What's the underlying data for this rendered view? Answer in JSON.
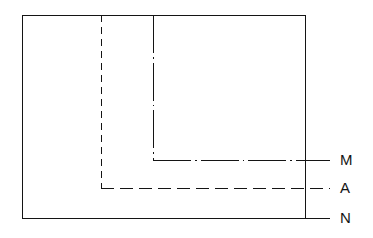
{
  "figure": {
    "kind": "engineering-line-drawing",
    "background_color": "#ffffff",
    "line_color": "#141414",
    "canvas": {
      "width": 373,
      "height": 238
    },
    "outline": {
      "name": "N",
      "shape": "rectangle",
      "style": "solid",
      "x": 22,
      "y": 15,
      "width": 283,
      "height": 203
    },
    "lines": [
      {
        "id": "vertical-hidden-line",
        "style": "dashed",
        "orientation": "vertical",
        "x": 101,
        "y1": 15,
        "y2": 188
      },
      {
        "id": "vertical-center-line",
        "style": "dash-dot",
        "orientation": "vertical",
        "x": 153,
        "y1": 15,
        "y2": 160
      },
      {
        "id": "m-horizontal-line",
        "style": "dash-dot",
        "orientation": "horizontal",
        "y": 160,
        "x1": 153,
        "x2": 330
      },
      {
        "id": "a-horizontal-line",
        "style": "dashed",
        "orientation": "horizontal",
        "y": 188,
        "x1": 101,
        "x2": 330
      },
      {
        "id": "n-leader-line",
        "style": "solid",
        "orientation": "horizontal",
        "y": 218,
        "x1": 305,
        "x2": 330
      }
    ],
    "labels": [
      {
        "id": "label-m",
        "text": "M",
        "x": 340,
        "y": 160
      },
      {
        "id": "label-a",
        "text": "A",
        "x": 340,
        "y": 188
      },
      {
        "id": "label-n",
        "text": "N",
        "x": 340,
        "y": 218
      }
    ]
  }
}
